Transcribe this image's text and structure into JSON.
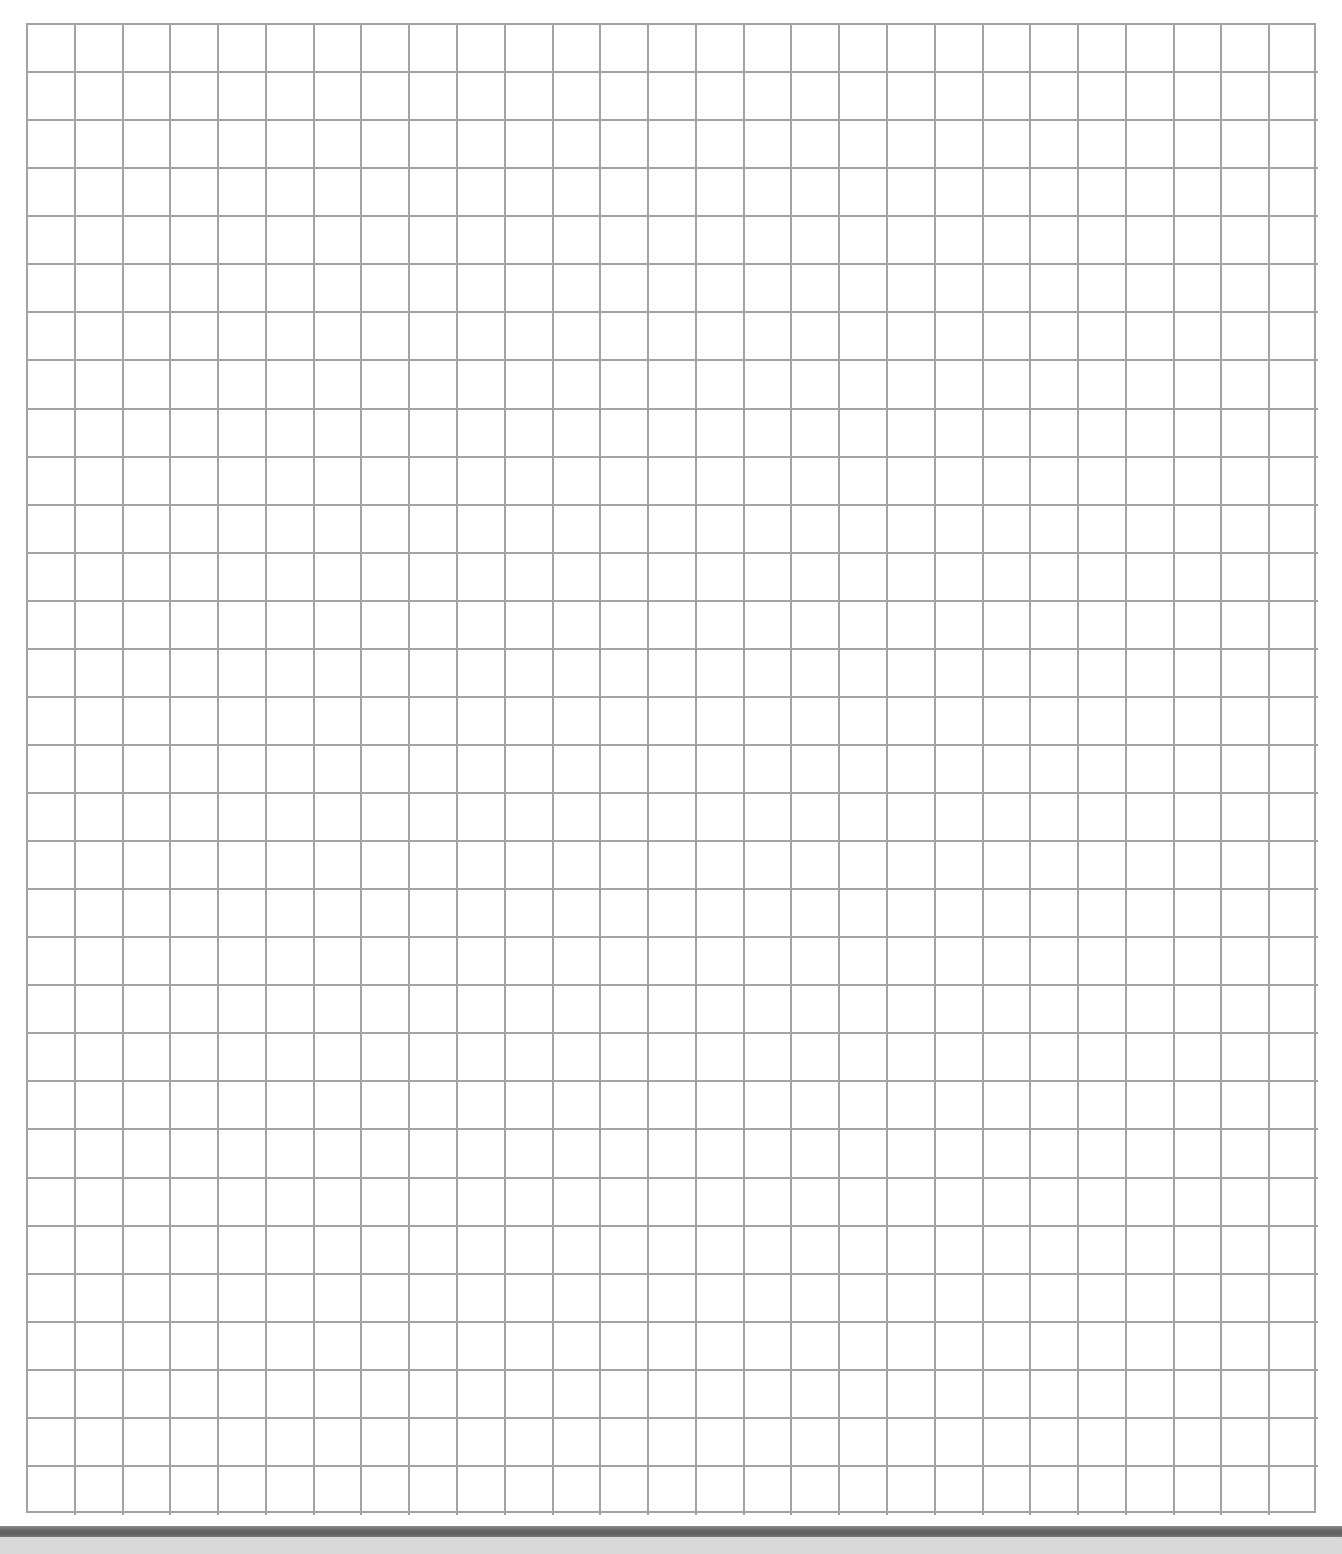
{
  "document": {
    "type": "graph-paper",
    "grid": {
      "columns": 27,
      "rows": 31,
      "line_color": "#a3a3a3",
      "background_color": "#ffffff"
    },
    "bottom_band": {
      "band_color": "#666666",
      "underlay_color": "#d9d9d9"
    }
  }
}
